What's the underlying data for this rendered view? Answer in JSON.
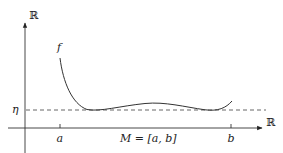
{
  "diagram": {
    "y_axis_label": "ℝ",
    "x_axis_label": "ℝ",
    "function_label": "f",
    "level_label": "η",
    "tick_a": "a",
    "tick_b": "b",
    "interval_label": "M = [a, b]",
    "colors": {
      "axis": "#333333",
      "curve": "#333333",
      "dashed_line": "#555555",
      "background": "#ffffff"
    }
  }
}
